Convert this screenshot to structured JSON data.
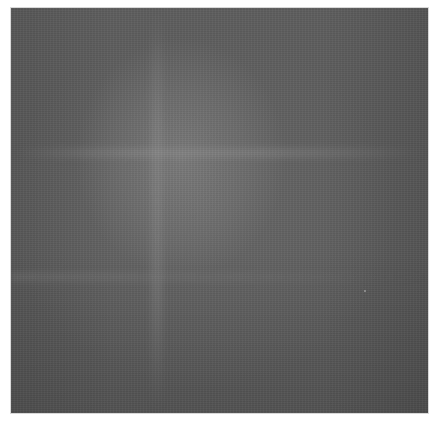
{
  "image": {
    "description": "Uniform gray square with subtle mottled texture and faint cross-shaped brightening",
    "colors": {
      "background": "#ffffff",
      "panel": "#5e5e5e",
      "highlight": "#8c8c8c"
    }
  }
}
